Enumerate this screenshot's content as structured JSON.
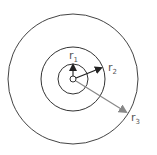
{
  "diagram": {
    "type": "concentric-circles",
    "labels": {
      "r1": {
        "base": "r",
        "sub": "1"
      },
      "r2": {
        "base": "r",
        "sub": "2"
      },
      "r3": {
        "base": "r",
        "sub": "3"
      }
    },
    "colors": {
      "circles": "#333333",
      "arrow_r1": "#333333",
      "arrow_r2": "#222222",
      "arrow_r3": "#888888"
    }
  }
}
